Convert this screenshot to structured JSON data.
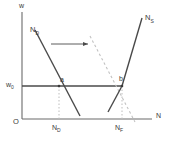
{
  "figure": {
    "type": "labor-market-diagram",
    "axes": {
      "y_label": "w",
      "x_label": "N",
      "origin_label": "O"
    },
    "wage_level": {
      "label_main": "w",
      "label_sub": "0"
    },
    "curves": [
      {
        "name": "labor-demand-initial",
        "label_main": "N",
        "label_sub": "D",
        "style": "solid",
        "slope": "downward"
      },
      {
        "name": "labor-demand-shifted",
        "label_main": "",
        "label_sub": "",
        "style": "dashed",
        "slope": "downward"
      },
      {
        "name": "labor-supply",
        "label_main": "N",
        "label_sub": "S",
        "style": "solid",
        "slope": "kinked-upward"
      }
    ],
    "points": [
      {
        "name": "point-a",
        "label": "a"
      },
      {
        "name": "point-b",
        "label": "b"
      }
    ],
    "x_ticks": [
      {
        "name": "x-tick-nd",
        "label_main": "N",
        "label_sub": "D"
      },
      {
        "name": "x-tick-nf",
        "label_main": "N",
        "label_sub": "F"
      }
    ],
    "annotations": [
      {
        "name": "shift-arrow",
        "label": "",
        "direction": "right"
      }
    ],
    "colors": {
      "axis": "#6b6b6b",
      "curve_solid": "#4a4a4a",
      "curve_dashed": "#c2c2c2",
      "guide_dotted": "#bdbdbd",
      "text": "#3a3a3a",
      "background": "#ffffff"
    }
  }
}
